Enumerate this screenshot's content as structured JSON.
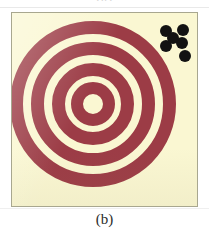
{
  "figure": {
    "caption_below": "(b)",
    "caption_above_partial": "(a)",
    "panel": {
      "background_color": "#faf7d2",
      "border_color": "#a8a78f",
      "left": 11,
      "top": 12,
      "width": 187,
      "height": 195
    },
    "page_background_color": "#ffffff",
    "ring_color": "#9c3c46",
    "dot_color": "#121212",
    "center_x": 92,
    "center_y": 103,
    "rings": [
      {
        "name": "ring-outer",
        "index": 1,
        "outer_radius": 83,
        "thickness": 13
      },
      {
        "name": "ring-second",
        "index": 2,
        "outer_radius": 62,
        "thickness": 13
      },
      {
        "name": "ring-third",
        "index": 3,
        "outer_radius": 41,
        "thickness": 13
      },
      {
        "name": "ring-bullseye",
        "index": 4,
        "outer_radius": 22,
        "thickness": 12
      }
    ],
    "ring_count": 4,
    "dots": [
      {
        "name": "pellet-hole-1",
        "cx": 165,
        "cy": 30,
        "r": 6
      },
      {
        "name": "pellet-hole-2",
        "cx": 182,
        "cy": 29,
        "r": 6
      },
      {
        "name": "pellet-hole-3",
        "cx": 165,
        "cy": 45,
        "r": 6
      },
      {
        "name": "pellet-hole-4",
        "cx": 181,
        "cy": 42,
        "r": 6
      },
      {
        "name": "pellet-hole-5",
        "cx": 184,
        "cy": 55,
        "r": 6
      },
      {
        "name": "pellet-hole-6",
        "cx": 172,
        "cy": 37,
        "r": 6
      }
    ],
    "dot_count": 6,
    "dot_cluster_location": "upper-right"
  }
}
